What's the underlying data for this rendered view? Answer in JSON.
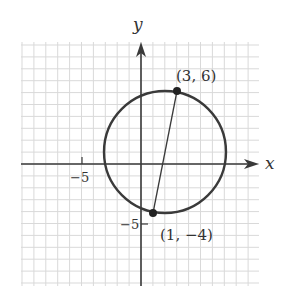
{
  "figure": {
    "type": "coordinate-plane-circle",
    "axes": {
      "x_label": "x",
      "y_label": "y",
      "x_tick_label": "−5",
      "y_tick_label": "−5"
    },
    "points": [
      {
        "label": "(3, 6)",
        "x": 3,
        "y": 6
      },
      {
        "label": "(1, −4)",
        "x": 1,
        "y": -4
      }
    ],
    "circle": {
      "center": [
        2,
        1
      ],
      "radius_squared": 26
    },
    "grid": {
      "x_range": [
        -10,
        10
      ],
      "y_range": [
        -10,
        10
      ],
      "unit_px": 12
    },
    "colors": {
      "grid": "#d9d9d9",
      "axes": "#3a3a3a",
      "curve": "#3a3a3a",
      "text": "#333333"
    }
  }
}
